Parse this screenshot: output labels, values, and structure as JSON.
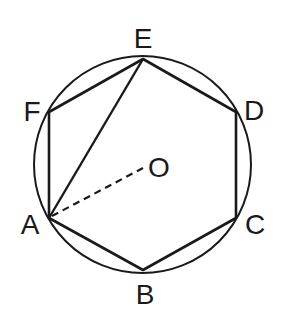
{
  "diagram": {
    "stroke_color": "#1a1a1a",
    "background": "#ffffff",
    "circle": {
      "center_label": "O",
      "cx": 142.5,
      "cy": 164.5,
      "r": 108.5
    },
    "vertices": [
      {
        "label": "A",
        "x": 49,
        "y": 218
      },
      {
        "label": "B",
        "x": 143,
        "y": 270
      },
      {
        "label": "C",
        "x": 236,
        "y": 218
      },
      {
        "label": "D",
        "x": 236,
        "y": 112
      },
      {
        "label": "E",
        "x": 143,
        "y": 59
      },
      {
        "label": "F",
        "x": 49,
        "y": 112
      }
    ],
    "labels": {
      "A": "A",
      "B": "B",
      "C": "C",
      "D": "D",
      "E": "E",
      "F": "F",
      "O": "O"
    },
    "segments": [
      {
        "from": "A",
        "to": "E",
        "style": "solid",
        "description": "diagonal AE"
      },
      {
        "from": "A",
        "to": "O",
        "style": "dashed",
        "description": "radius AO"
      }
    ]
  }
}
